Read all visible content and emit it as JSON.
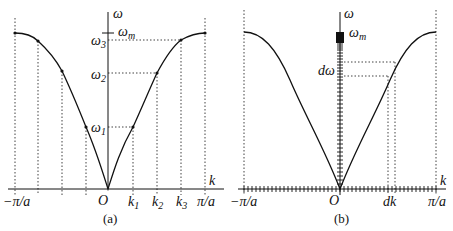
{
  "panel_a": {
    "caption": "(a)",
    "y_axis_label": "ω",
    "x_axis_label": "k",
    "origin_label": "O",
    "omega_m_label": "ω",
    "omega_m_sub": "m",
    "omega_labels": [
      {
        "main": "ω",
        "sub": "3"
      },
      {
        "main": "ω",
        "sub": "2"
      },
      {
        "main": "ω",
        "sub": "1"
      }
    ],
    "k_labels": [
      {
        "main": "k",
        "sub": "1"
      },
      {
        "main": "k",
        "sub": "2"
      },
      {
        "main": "k",
        "sub": "3"
      }
    ],
    "left_limit": "−π/a",
    "right_limit": "π/a"
  },
  "panel_b": {
    "caption": "(b)",
    "y_axis_label": "ω",
    "x_axis_label": "k",
    "origin_label": "O",
    "omega_m_label": "ω",
    "omega_m_sub": "m",
    "d_omega_label": "dω",
    "d_k_label": "dk",
    "left_limit": "−π/a",
    "right_limit": "π/a"
  },
  "colors": {
    "line": "#111111",
    "background": "#ffffff"
  }
}
